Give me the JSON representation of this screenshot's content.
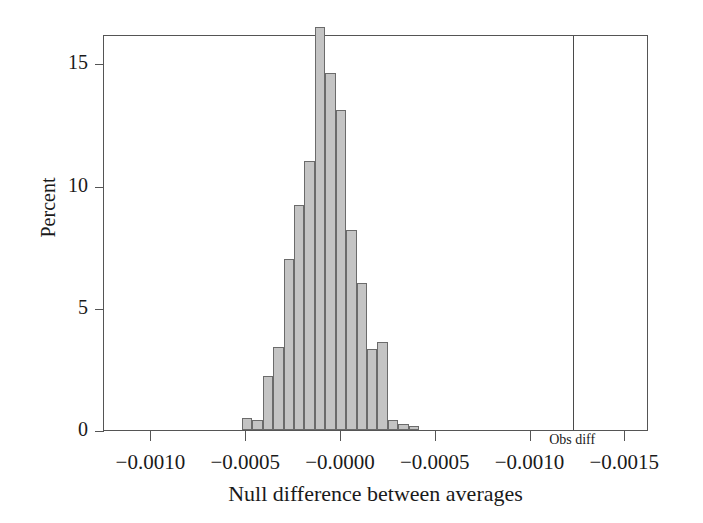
{
  "chart_data": {
    "type": "bar",
    "title": "",
    "subtitle": "",
    "xlabel": "Null difference between averages",
    "ylabel": "Percent",
    "grid": false,
    "legend": null,
    "xlim": [
      -0.00125,
      0.001625
    ],
    "ylim": [
      0,
      16.2
    ],
    "ytick_values": [
      0,
      5,
      10,
      15
    ],
    "ytick_labels": [
      "0",
      "5",
      "10",
      "15"
    ],
    "xtick_values": [
      -0.001,
      -0.0005,
      -0.0,
      0.0005,
      0.001,
      0.0015
    ],
    "xtick_labels": [
      "−0.0010",
      "−0.0005",
      "−0.0000",
      "−0.0005",
      "−0.0010",
      "−0.0015"
    ],
    "bin_width": 5.5e-05,
    "categories": [
      "-0.000495",
      "-0.000440",
      "-0.000385",
      "-0.000330",
      "-0.000275",
      "-0.000220",
      "-0.000165",
      "-0.000110",
      "-0.000055",
      "0.000000",
      "0.000055",
      "0.000110",
      "0.000165",
      "0.000220",
      "0.000275",
      "0.000330",
      "0.000385",
      "0.000440",
      "0.000495",
      "0.000550",
      "0.000605"
    ],
    "values": [
      0.5,
      0.4,
      2.2,
      3.4,
      7.0,
      9.2,
      11.0,
      16.5,
      14.6,
      13.1,
      8.2,
      6.0,
      3.3,
      3.6,
      0.4,
      0.25,
      0.15,
      0,
      0,
      0,
      0
    ],
    "annotations": [
      {
        "name": "obs-diff",
        "label": "Obs diff",
        "x": 0.001225,
        "type": "vertical-line"
      }
    ],
    "colors": {
      "bar_fill": "#c4c4c4",
      "bar_edge": "#6b6b6b",
      "axis": "#555555",
      "text": "#1a1a1a",
      "background": "#ffffff"
    }
  }
}
